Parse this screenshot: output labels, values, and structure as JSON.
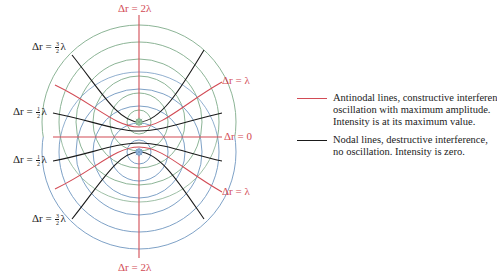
{
  "figure": {
    "colors": {
      "antinodal": "#d24b55",
      "nodal": "#1a1a1a",
      "source1_waves": "#7fab8a",
      "source2_waves": "#6f96c0"
    },
    "sources": [
      {
        "name": "source-upper",
        "color": "#7fab8a"
      },
      {
        "name": "source-lower",
        "color": "#6f96c0"
      }
    ]
  },
  "labels": {
    "top": "Δr = 2λ",
    "bottom": "Δr = 2λ",
    "right_upper": "Δr = λ",
    "right_center": "Δr = 0",
    "right_lower": "Δr = λ",
    "left_upper_outer": {
      "prefix": "Δr = ",
      "num": "3",
      "den": "2",
      "suffix": "λ"
    },
    "left_upper_inner": {
      "prefix": "Δr = ",
      "num": "1",
      "den": "2",
      "suffix": "λ"
    },
    "left_lower_inner": {
      "prefix": "Δr = ",
      "num": "1",
      "den": "2",
      "suffix": "λ"
    },
    "left_lower_outer": {
      "prefix": "Δr = ",
      "num": "3",
      "den": "2",
      "suffix": "λ"
    }
  },
  "legend": {
    "antinodal": {
      "lines": [
        "Antinodal lines, constructive interferen",
        "oscillation with maximum amplitude.",
        "Intensity is at its maximum value."
      ]
    },
    "nodal": {
      "lines": [
        "Nodal lines, destructive interference,",
        "no oscillation. Intensity is zero."
      ]
    }
  }
}
